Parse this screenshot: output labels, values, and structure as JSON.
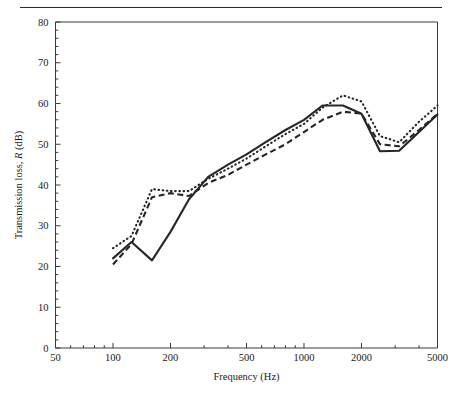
{
  "figure": {
    "has_top_rule": true,
    "background_color": "#ffffff",
    "ink_color": "#262626"
  },
  "chart_data": {
    "type": "line",
    "title": "",
    "xlabel": "Frequency (Hz)",
    "ylabel_prefix": "Transmission loss, ",
    "ylabel_italic": "R",
    "ylabel_suffix": " (dB)",
    "xscale": "log",
    "xlim": [
      50,
      5000
    ],
    "ylim": [
      0,
      80
    ],
    "xticks": [
      50,
      100,
      200,
      500,
      1000,
      2000,
      5000
    ],
    "xtick_labels": [
      "50",
      "100",
      "200",
      "500",
      "1000",
      "2000",
      "5000"
    ],
    "yticks": [
      0,
      10,
      20,
      30,
      40,
      50,
      60,
      70,
      80
    ],
    "ytick_labels": [
      "0",
      "10",
      "20",
      "30",
      "40",
      "50",
      "60",
      "70",
      "80"
    ],
    "y_minor_tick_step": 2,
    "grid": false,
    "legend": null,
    "series": [
      {
        "name": "solid",
        "style": "solid",
        "color": "#262626",
        "x": [
          100,
          125,
          160,
          200,
          250,
          315,
          400,
          500,
          630,
          800,
          1000,
          1250,
          1600,
          2000,
          2500,
          3150,
          4000,
          5000
        ],
        "values": [
          22.0,
          26.0,
          21.5,
          28.5,
          36.5,
          42.0,
          45.0,
          47.5,
          50.5,
          53.5,
          56.0,
          59.5,
          59.5,
          57.5,
          48.3,
          48.4,
          53.0,
          57.3
        ]
      },
      {
        "name": "dashed",
        "style": "dashed",
        "color": "#262626",
        "x": [
          100,
          125,
          160,
          200,
          250,
          315,
          400,
          500,
          630,
          800,
          1000,
          1250,
          1600,
          2000,
          2500,
          3150,
          4000,
          5000
        ],
        "values": [
          20.5,
          25.5,
          37.0,
          38.0,
          37.3,
          40.5,
          42.5,
          45.0,
          47.5,
          50.0,
          53.0,
          56.0,
          58.0,
          57.5,
          50.0,
          49.5,
          53.5,
          57.5
        ]
      },
      {
        "name": "dotted",
        "style": "dotted",
        "color": "#262626",
        "x": [
          100,
          125,
          160,
          200,
          250,
          315,
          400,
          500,
          630,
          800,
          1000,
          1250,
          1600,
          2000,
          2500,
          3150,
          4000,
          5000
        ],
        "values": [
          24.5,
          27.5,
          39.0,
          38.5,
          38.5,
          41.5,
          44.0,
          46.5,
          49.5,
          52.5,
          55.0,
          59.0,
          62.0,
          60.5,
          52.0,
          50.5,
          55.5,
          59.5
        ]
      }
    ]
  }
}
